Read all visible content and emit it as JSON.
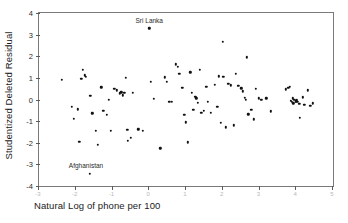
{
  "chart_data": {
    "type": "scatter",
    "title": "",
    "xlabel": "Natural Log of phone per 100",
    "ylabel": "Studentized Deleted Residual",
    "xlim": [
      -3,
      5
    ],
    "ylim": [
      -4,
      4
    ],
    "grid": false,
    "legend": null,
    "xticks": [
      -3,
      -2,
      -1,
      0,
      1,
      2,
      3,
      4,
      5
    ],
    "xtick_labels": [
      "-3",
      "-2",
      "-1",
      "0",
      "1",
      "2",
      "3",
      "4",
      "5"
    ],
    "yticks": [
      4,
      3,
      2,
      1,
      0,
      -1,
      -2,
      -3,
      -4
    ],
    "ytick_labels": [
      "4",
      "3",
      "2",
      "1",
      "0",
      "-1",
      "-2",
      "-3",
      "-4"
    ],
    "marker": "filled-circle",
    "marker_color": "#111111",
    "annotations": [
      {
        "label": "Sri Lanka",
        "x": 0.0,
        "y": 3.62,
        "point_x": 0.0,
        "point_y": 3.3
      },
      {
        "label": "Afghanistan",
        "x": -1.72,
        "y": -3.08,
        "point_x": -1.62,
        "point_y": -3.45
      }
    ],
    "points": [
      {
        "x": -2.38,
        "y": 0.9
      },
      {
        "x": -2.1,
        "y": -0.33
      },
      {
        "x": -2.05,
        "y": -0.9
      },
      {
        "x": -1.95,
        "y": -0.45
      },
      {
        "x": -1.9,
        "y": -1.95
      },
      {
        "x": -1.85,
        "y": 0.97
      },
      {
        "x": -1.8,
        "y": 1.37
      },
      {
        "x": -1.75,
        "y": 1.12
      },
      {
        "x": -1.72,
        "y": 1.04
      },
      {
        "x": -1.62,
        "y": -3.45
      },
      {
        "x": -1.6,
        "y": 0.16
      },
      {
        "x": -1.55,
        "y": -0.63
      },
      {
        "x": -1.45,
        "y": -1.45
      },
      {
        "x": -1.4,
        "y": -2.1
      },
      {
        "x": -1.3,
        "y": 0.56
      },
      {
        "x": -1.25,
        "y": -0.52
      },
      {
        "x": -1.15,
        "y": -0.72
      },
      {
        "x": -1.1,
        "y": -0.02
      },
      {
        "x": -1.05,
        "y": -1.45
      },
      {
        "x": -0.95,
        "y": 0.5
      },
      {
        "x": -0.88,
        "y": 0.42
      },
      {
        "x": -0.8,
        "y": 0.28
      },
      {
        "x": -0.76,
        "y": 0.34
      },
      {
        "x": -0.72,
        "y": 0.2
      },
      {
        "x": -0.68,
        "y": 0.3
      },
      {
        "x": -0.64,
        "y": 1.0
      },
      {
        "x": -0.6,
        "y": -1.4
      },
      {
        "x": -0.58,
        "y": -1.92
      },
      {
        "x": -0.5,
        "y": -1.78
      },
      {
        "x": -0.45,
        "y": 0.3
      },
      {
        "x": -0.3,
        "y": -1.38
      },
      {
        "x": -0.18,
        "y": -1.45
      },
      {
        "x": 0.0,
        "y": 3.3
      },
      {
        "x": 0.05,
        "y": 0.83
      },
      {
        "x": 0.12,
        "y": 0.02
      },
      {
        "x": 0.3,
        "y": -2.25
      },
      {
        "x": 0.42,
        "y": 1.02
      },
      {
        "x": 0.48,
        "y": 0.82
      },
      {
        "x": 0.55,
        "y": -0.12
      },
      {
        "x": 0.62,
        "y": -0.1
      },
      {
        "x": 0.72,
        "y": 1.62
      },
      {
        "x": 0.78,
        "y": 1.5
      },
      {
        "x": 0.82,
        "y": 1.18
      },
      {
        "x": 0.9,
        "y": 0.55
      },
      {
        "x": 0.95,
        "y": -0.7
      },
      {
        "x": 1.0,
        "y": -1.05
      },
      {
        "x": 1.05,
        "y": -1.98
      },
      {
        "x": 1.12,
        "y": 1.25
      },
      {
        "x": 1.15,
        "y": 0.3
      },
      {
        "x": 1.2,
        "y": -0.48
      },
      {
        "x": 1.25,
        "y": 0.12
      },
      {
        "x": 1.28,
        "y": 0.05
      },
      {
        "x": 1.32,
        "y": -0.15
      },
      {
        "x": 1.38,
        "y": 1.38
      },
      {
        "x": 1.42,
        "y": -0.62
      },
      {
        "x": 1.48,
        "y": -0.52
      },
      {
        "x": 1.55,
        "y": 0.6
      },
      {
        "x": 1.6,
        "y": -0.1
      },
      {
        "x": 1.68,
        "y": -0.62
      },
      {
        "x": 1.78,
        "y": 0.68
      },
      {
        "x": 1.85,
        "y": -0.35
      },
      {
        "x": 1.9,
        "y": 1.08
      },
      {
        "x": 1.95,
        "y": -1.08
      },
      {
        "x": 2.0,
        "y": 2.67
      },
      {
        "x": 2.02,
        "y": 1.05
      },
      {
        "x": 2.08,
        "y": -1.28
      },
      {
        "x": 2.15,
        "y": 0.72
      },
      {
        "x": 2.22,
        "y": 0.65
      },
      {
        "x": 2.3,
        "y": -1.2
      },
      {
        "x": 2.35,
        "y": 1.2
      },
      {
        "x": 2.42,
        "y": 0.62
      },
      {
        "x": 2.5,
        "y": 0.52
      },
      {
        "x": 2.55,
        "y": 0.38
      },
      {
        "x": 2.6,
        "y": 0.08
      },
      {
        "x": 2.62,
        "y": 0.0
      },
      {
        "x": 2.65,
        "y": 1.95
      },
      {
        "x": 2.7,
        "y": -0.68
      },
      {
        "x": 2.78,
        "y": -0.48
      },
      {
        "x": 2.85,
        "y": -0.92
      },
      {
        "x": 2.9,
        "y": 0.5
      },
      {
        "x": 2.98,
        "y": 0.05
      },
      {
        "x": 3.05,
        "y": 0.0
      },
      {
        "x": 3.18,
        "y": 0.05
      },
      {
        "x": 3.3,
        "y": -0.55
      },
      {
        "x": 3.72,
        "y": 0.48
      },
      {
        "x": 3.78,
        "y": 0.55
      },
      {
        "x": 3.82,
        "y": 0.58
      },
      {
        "x": 3.85,
        "y": -0.05
      },
      {
        "x": 3.88,
        "y": -0.1
      },
      {
        "x": 3.9,
        "y": 0.05
      },
      {
        "x": 3.92,
        "y": -0.18
      },
      {
        "x": 3.95,
        "y": -0.02
      },
      {
        "x": 3.98,
        "y": -0.12
      },
      {
        "x": 4.0,
        "y": -0.08
      },
      {
        "x": 4.02,
        "y": 0.0
      },
      {
        "x": 4.05,
        "y": -0.12
      },
      {
        "x": 4.08,
        "y": -0.2
      },
      {
        "x": 4.1,
        "y": -0.85
      },
      {
        "x": 4.18,
        "y": 0.1
      },
      {
        "x": 4.22,
        "y": -0.25
      },
      {
        "x": 4.32,
        "y": 0.42
      },
      {
        "x": 4.38,
        "y": -0.3
      },
      {
        "x": 4.45,
        "y": -0.18
      }
    ]
  }
}
